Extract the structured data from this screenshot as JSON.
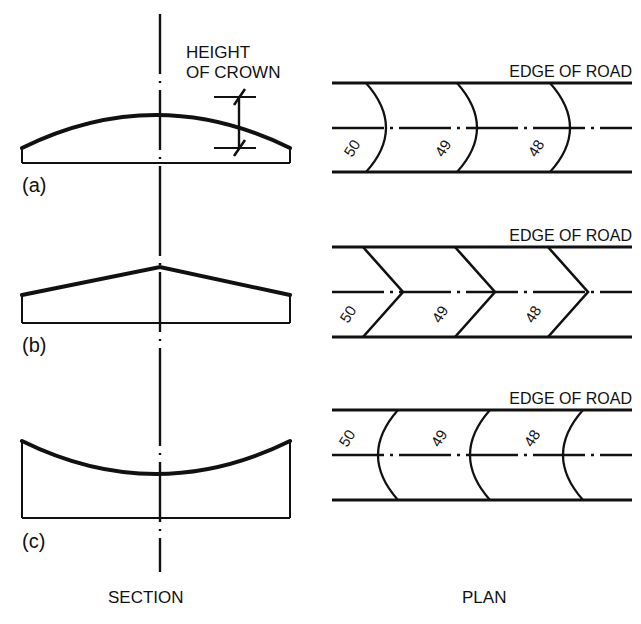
{
  "figure": {
    "background_color": "#ffffff",
    "line_color": "#111111",
    "columns": [
      {
        "id": "section",
        "caption": "SECTION"
      },
      {
        "id": "plan",
        "caption": "PLAN"
      }
    ],
    "annotations": {
      "height_of_crown_line1": "HEIGHT",
      "height_of_crown_line2": "OF CROWN"
    },
    "rows": [
      {
        "key": "a",
        "label": "(a)",
        "section_profile": "parabolic-crown",
        "plan_contour_shape": "curved-bulge-right",
        "edge_of_road_label": "EDGE OF ROAD",
        "contour_labels": [
          "50",
          "49",
          "48"
        ]
      },
      {
        "key": "b",
        "label": "(b)",
        "section_profile": "straight-gabled-crown",
        "plan_contour_shape": "chevron-point-right",
        "edge_of_road_label": "EDGE OF ROAD",
        "contour_labels": [
          "50",
          "49",
          "48"
        ]
      },
      {
        "key": "c",
        "label": "(c)",
        "section_profile": "concave-dished",
        "plan_contour_shape": "curved-bulge-left",
        "edge_of_road_label": "EDGE OF ROAD",
        "contour_labels": [
          "50",
          "49",
          "48"
        ]
      }
    ]
  }
}
